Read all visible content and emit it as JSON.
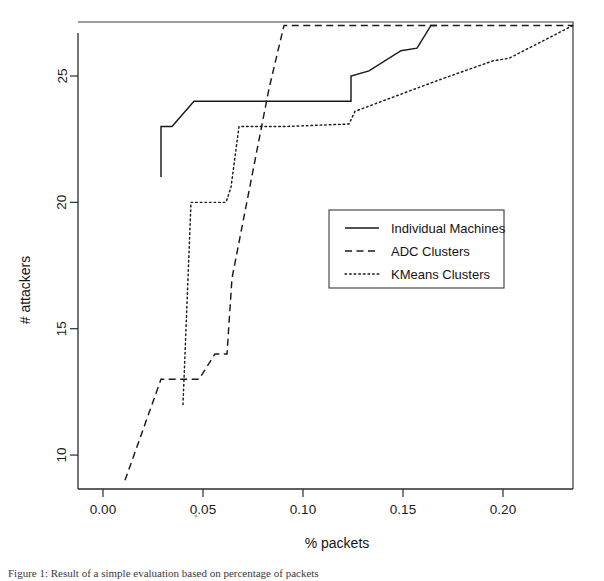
{
  "figure": {
    "caption_partial": "Figure 1: Result of a simple evaluation based on percentage of packets"
  },
  "chart_data": {
    "type": "line",
    "title": "",
    "xlabel": "% packets",
    "ylabel": "# attackers",
    "xlim": [
      -0.0055,
      0.2385
    ],
    "ylim": [
      8.55,
      27.45
    ],
    "xticks": [
      0.0,
      0.05,
      0.1,
      0.15,
      0.2
    ],
    "xticklabels": [
      "0.00",
      "0.05",
      "0.10",
      "0.15",
      "0.20"
    ],
    "yticks": [
      10,
      15,
      20,
      25
    ],
    "yticklabels": [
      "10",
      "15",
      "20",
      "25"
    ],
    "grid": false,
    "legend_position": "center-right",
    "series": [
      {
        "name": "Individual Machines",
        "style": "solid",
        "color": "#1a1a1a",
        "points": [
          [
            0.029,
            21.0
          ],
          [
            0.029,
            23.0
          ],
          [
            0.0345,
            23.0
          ],
          [
            0.0455,
            24.0
          ],
          [
            0.1215,
            24.0
          ],
          [
            0.124,
            24.0
          ],
          [
            0.124,
            25.0
          ],
          [
            0.133,
            25.2
          ],
          [
            0.149,
            26.0
          ],
          [
            0.157,
            26.1
          ],
          [
            0.164,
            27.0
          ],
          [
            0.167,
            27.0
          ]
        ]
      },
      {
        "name": "ADC Clusters",
        "style": "dashed",
        "color": "#1a1a1a",
        "points": [
          [
            0.011,
            9.0
          ],
          [
            0.029,
            13.0
          ],
          [
            0.048,
            13.0
          ],
          [
            0.056,
            14.0
          ],
          [
            0.062,
            14.0
          ],
          [
            0.0645,
            17.0
          ],
          [
            0.083,
            24.5
          ],
          [
            0.0905,
            27.0
          ],
          [
            0.235,
            27.0
          ]
        ]
      },
      {
        "name": "KMeans Clusters",
        "style": "dotted",
        "color": "#1a1a1a",
        "points": [
          [
            0.04,
            12.0
          ],
          [
            0.044,
            20.0
          ],
          [
            0.0615,
            20.0
          ],
          [
            0.064,
            20.6
          ],
          [
            0.068,
            23.0
          ],
          [
            0.0905,
            23.0
          ],
          [
            0.123,
            23.1
          ],
          [
            0.126,
            23.6
          ],
          [
            0.153,
            24.4
          ],
          [
            0.17,
            24.9
          ],
          [
            0.195,
            25.6
          ],
          [
            0.203,
            25.7
          ],
          [
            0.235,
            27.0
          ]
        ]
      }
    ]
  },
  "legend": {
    "items": [
      {
        "label": "Individual Machines",
        "style": "solid"
      },
      {
        "label": "ADC Clusters",
        "style": "dashed"
      },
      {
        "label": "KMeans Clusters",
        "style": "dotted"
      }
    ]
  }
}
